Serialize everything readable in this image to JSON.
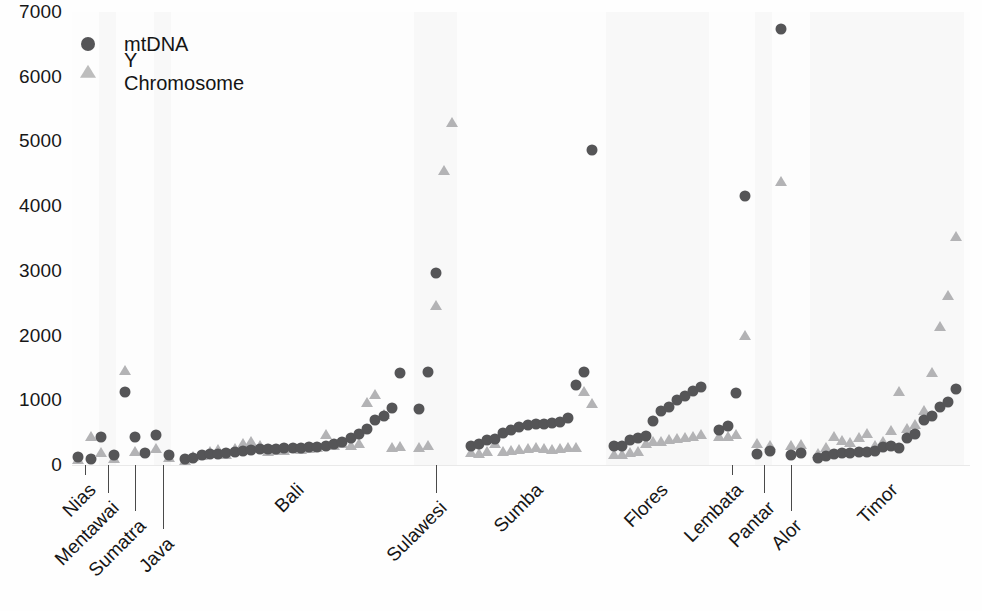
{
  "chart_data": {
    "type": "scatter",
    "title": "",
    "xlabel": "",
    "ylabel": "",
    "ylim": [
      0,
      7000
    ],
    "yticks": [
      0,
      1000,
      2000,
      3000,
      4000,
      5000,
      6000,
      7000
    ],
    "ytick_labels": [
      "0",
      "1000",
      "2000",
      "3000",
      "4000",
      "5000",
      "6000",
      "7000"
    ],
    "grid": false,
    "legend_position": "top-left",
    "series": [
      {
        "name": "mtDNA",
        "marker": "circle",
        "color": "#555557"
      },
      {
        "name": "Y Chromosome",
        "marker": "triangle",
        "color": "#b3b3b5"
      }
    ],
    "group_order": [
      "Nias",
      "Mentawai",
      "Sumatra",
      "Java",
      "Bali",
      "Sulawesi",
      "Sumba",
      "Flores",
      "Lembata",
      "Pantar",
      "Alor",
      "Timor"
    ],
    "groups": [
      {
        "label": "Nias",
        "mtDNA": [
          120,
          95
        ],
        "Y": [
          70,
          430
        ]
      },
      {
        "label": "Mentawai",
        "mtDNA": [
          430,
          150
        ],
        "Y": [
          180,
          90
        ]
      },
      {
        "label": "Sumatra",
        "mtDNA": [
          1130,
          440,
          180
        ],
        "Y": [
          1450,
          200
        ]
      },
      {
        "label": "Java",
        "mtDNA": [
          460,
          160
        ],
        "Y": [
          250,
          110
        ]
      },
      {
        "label": "Bali",
        "mtDNA": [
          90,
          110,
          150,
          170,
          175,
          185,
          200,
          215,
          230,
          240,
          250,
          245,
          260,
          255,
          265,
          275,
          280,
          300,
          330,
          350,
          420,
          480,
          560,
          700,
          760,
          880,
          1420
        ],
        "Y": [
          60,
          120,
          140,
          200,
          230,
          160,
          250,
          330,
          360,
          300,
          200,
          220,
          210,
          240,
          230,
          250,
          260,
          470,
          300,
          330,
          290,
          320,
          960,
          1080,
          780,
          260,
          280
        ]
      },
      {
        "label": "Sulawesi",
        "mtDNA": [
          860,
          1430,
          2960
        ],
        "Y": [
          260,
          300,
          2450,
          4540,
          5290
        ]
      },
      {
        "label": "Sumba",
        "mtDNA": [
          290,
          330,
          380,
          400,
          490,
          540,
          590,
          620,
          630,
          640,
          650,
          660,
          720,
          1240,
          1430,
          4860
        ],
        "Y": [
          180,
          170,
          200,
          330,
          200,
          210,
          230,
          250,
          260,
          250,
          230,
          240,
          260,
          270,
          1130,
          940
        ]
      },
      {
        "label": "Flores",
        "mtDNA": [
          290,
          300,
          390,
          420,
          450,
          680,
          830,
          900,
          1000,
          1060,
          1150,
          1200
        ],
        "Y": [
          150,
          160,
          180,
          200,
          330,
          350,
          360,
          380,
          400,
          420,
          430,
          460
        ]
      },
      {
        "label": "Lembata",
        "mtDNA": [
          540,
          600,
          1120,
          4150
        ],
        "Y": [
          430,
          440,
          470,
          1990
        ]
      },
      {
        "label": "Pantar",
        "mtDNA": [
          170,
          210
        ],
        "Y": [
          320,
          300
        ]
      },
      {
        "label": "Alor",
        "mtDNA": [
          6730,
          150,
          180
        ],
        "Y": [
          4380,
          290,
          310
        ]
      },
      {
        "label": "Timor",
        "mtDNA": [
          110,
          140,
          170,
          180,
          190,
          195,
          200,
          210,
          280,
          300,
          260,
          420,
          480,
          700,
          760,
          900,
          980,
          1180
        ],
        "Y": [
          170,
          260,
          430,
          370,
          340,
          420,
          480,
          300,
          350,
          520,
          1130,
          560,
          620,
          840,
          1420,
          2140,
          2610,
          3530
        ]
      }
    ],
    "annotations": {
      "max_point": 6730,
      "max_point_group": "Alor"
    }
  },
  "legend": {
    "entries": [
      {
        "label": "mtDNA",
        "marker": "circle-marker-icon"
      },
      {
        "label": "Y Chromosome",
        "marker": "triangle-marker-icon"
      }
    ]
  },
  "colors": {
    "mtdna": "#555557",
    "y_chromosome": "#b3b3b5",
    "text": "#161616",
    "background": "#ffffff"
  }
}
